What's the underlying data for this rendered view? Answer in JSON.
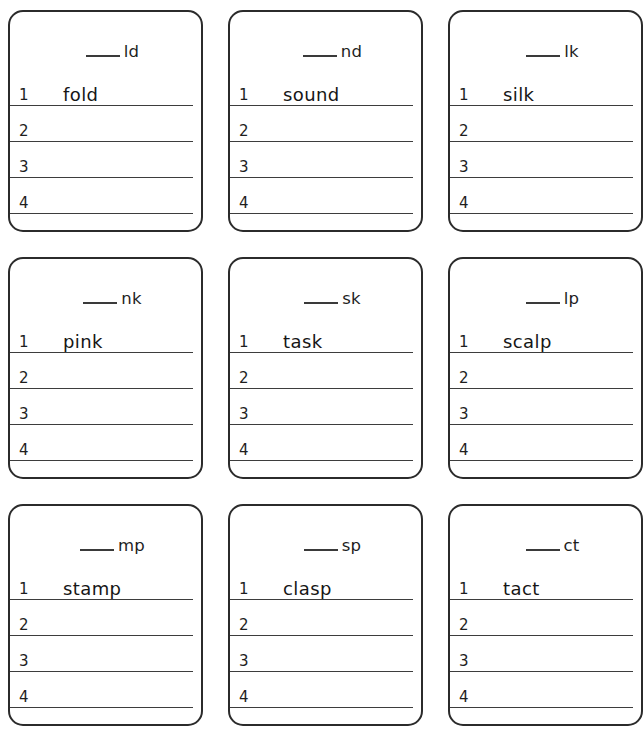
{
  "worksheet": {
    "blank_mark": "___",
    "line_numbers": [
      "1",
      "2",
      "3",
      "4"
    ],
    "cards": [
      {
        "blend": "ld",
        "example_word": "fold",
        "lines": [
          {
            "number": "1",
            "word": "fold"
          },
          {
            "number": "2",
            "word": ""
          },
          {
            "number": "3",
            "word": ""
          },
          {
            "number": "4",
            "word": ""
          }
        ]
      },
      {
        "blend": "nd",
        "example_word": "sound",
        "lines": [
          {
            "number": "1",
            "word": "sound"
          },
          {
            "number": "2",
            "word": ""
          },
          {
            "number": "3",
            "word": ""
          },
          {
            "number": "4",
            "word": ""
          }
        ]
      },
      {
        "blend": "lk",
        "example_word": "silk",
        "lines": [
          {
            "number": "1",
            "word": "silk"
          },
          {
            "number": "2",
            "word": ""
          },
          {
            "number": "3",
            "word": ""
          },
          {
            "number": "4",
            "word": ""
          }
        ]
      },
      {
        "blend": "nk",
        "example_word": "pink",
        "lines": [
          {
            "number": "1",
            "word": "pink"
          },
          {
            "number": "2",
            "word": ""
          },
          {
            "number": "3",
            "word": ""
          },
          {
            "number": "4",
            "word": ""
          }
        ]
      },
      {
        "blend": "sk",
        "example_word": "task",
        "lines": [
          {
            "number": "1",
            "word": "task"
          },
          {
            "number": "2",
            "word": ""
          },
          {
            "number": "3",
            "word": ""
          },
          {
            "number": "4",
            "word": ""
          }
        ]
      },
      {
        "blend": "lp",
        "example_word": "scalp",
        "lines": [
          {
            "number": "1",
            "word": "scalp"
          },
          {
            "number": "2",
            "word": ""
          },
          {
            "number": "3",
            "word": ""
          },
          {
            "number": "4",
            "word": ""
          }
        ]
      },
      {
        "blend": "mp",
        "example_word": "stamp",
        "lines": [
          {
            "number": "1",
            "word": "stamp"
          },
          {
            "number": "2",
            "word": ""
          },
          {
            "number": "3",
            "word": ""
          },
          {
            "number": "4",
            "word": ""
          }
        ]
      },
      {
        "blend": "sp",
        "example_word": "clasp",
        "lines": [
          {
            "number": "1",
            "word": "clasp"
          },
          {
            "number": "2",
            "word": ""
          },
          {
            "number": "3",
            "word": ""
          },
          {
            "number": "4",
            "word": ""
          }
        ]
      },
      {
        "blend": "ct",
        "example_word": "tact",
        "lines": [
          {
            "number": "1",
            "word": "tact"
          },
          {
            "number": "2",
            "word": ""
          },
          {
            "number": "3",
            "word": ""
          },
          {
            "number": "4",
            "word": ""
          }
        ]
      }
    ]
  },
  "colors": {
    "card_border": "#2b2b2b",
    "rule_line": "#3d3d3d",
    "text": "#1e1e1e",
    "page_background": "#ffffff"
  }
}
